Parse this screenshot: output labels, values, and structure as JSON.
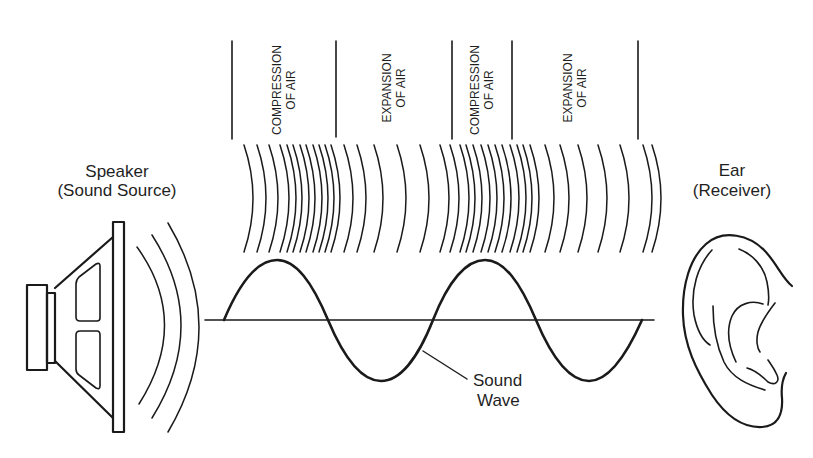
{
  "diagram": {
    "type": "sound-propagation",
    "colors": {
      "ink": "#1a1a1a",
      "background": "#ffffff"
    },
    "speaker": {
      "label_line1": "Speaker",
      "label_line2": "(Sound Source)"
    },
    "receiver": {
      "label_line1": "Ear",
      "label_line2": "(Receiver)"
    },
    "regions": [
      {
        "kind": "compression",
        "line1": "COMPRESSION",
        "line2": "OF AIR",
        "x_start": 232,
        "x_end": 336
      },
      {
        "kind": "expansion",
        "line1": "EXPANSION",
        "line2": "OF AIR",
        "x_start": 336,
        "x_end": 452
      },
      {
        "kind": "compression",
        "line1": "COMPRESSION",
        "line2": "OF AIR",
        "x_start": 452,
        "x_end": 512
      },
      {
        "kind": "expansion",
        "line1": "EXPANSION",
        "line2": "OF AIR",
        "x_start": 512,
        "x_end": 638
      }
    ],
    "wave": {
      "label_line1": "Sound",
      "label_line2": "Wave",
      "cycles": 2
    }
  }
}
